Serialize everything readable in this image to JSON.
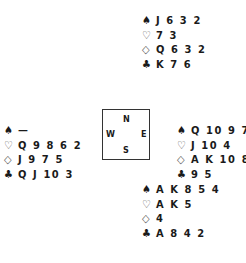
{
  "suit_symbols": {
    "spades": "♠",
    "hearts": "♡",
    "diamonds": "◇",
    "clubs": "♣"
  },
  "hands": {
    "north": {
      "spades": "J 6 3 2",
      "hearts": "7 3",
      "diamonds": "Q 6 3 2",
      "clubs": "K 7 6"
    },
    "west": {
      "spades": "—",
      "hearts": "Q 9 8 6 2",
      "diamonds": "J 9 7 5",
      "clubs": "Q J 10 3"
    },
    "east": {
      "spades": "Q 10 9 7",
      "hearts": "J 10 4",
      "diamonds": "A K 10 8",
      "clubs": "9 5"
    },
    "south": {
      "spades": "A K 8 5 4",
      "hearts": "A K 5",
      "diamonds": "4",
      "clubs": "A 8 4 2"
    }
  },
  "compass": {
    "north": "N",
    "west": "W",
    "east": "E",
    "south": "S"
  }
}
